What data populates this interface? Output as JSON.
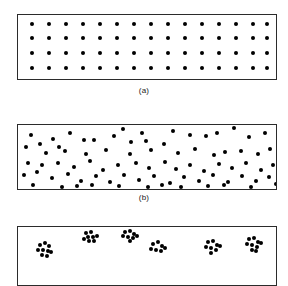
{
  "figure": {
    "background_color": "#ffffff",
    "dot_color": "#000000",
    "border_color": "#2b2b2b",
    "caption_color": "#1a1a1a"
  },
  "panels": [
    {
      "id": "panel-a",
      "caption": "(a)",
      "pattern": "regular",
      "box": {
        "x": 17,
        "y": 14,
        "w": 260,
        "h": 66
      },
      "dot_radius": 2.1,
      "rows": 4,
      "columns": 15,
      "points": [
        [
          14,
          9
        ],
        [
          31,
          9
        ],
        [
          48,
          9
        ],
        [
          65,
          9
        ],
        [
          82,
          9
        ],
        [
          99,
          9
        ],
        [
          116,
          9
        ],
        [
          133,
          9
        ],
        [
          150,
          9
        ],
        [
          167,
          9
        ],
        [
          184,
          9
        ],
        [
          201,
          9
        ],
        [
          218,
          9
        ],
        [
          235,
          9
        ],
        [
          249,
          9
        ],
        [
          14,
          23
        ],
        [
          31,
          23
        ],
        [
          48,
          23
        ],
        [
          65,
          23
        ],
        [
          82,
          23
        ],
        [
          99,
          23
        ],
        [
          116,
          23
        ],
        [
          133,
          23
        ],
        [
          150,
          23
        ],
        [
          167,
          23
        ],
        [
          184,
          23
        ],
        [
          201,
          23
        ],
        [
          218,
          23
        ],
        [
          235,
          23
        ],
        [
          249,
          23
        ],
        [
          14,
          38
        ],
        [
          31,
          38
        ],
        [
          48,
          38
        ],
        [
          65,
          38
        ],
        [
          82,
          38
        ],
        [
          99,
          38
        ],
        [
          116,
          38
        ],
        [
          133,
          38
        ],
        [
          150,
          38
        ],
        [
          167,
          38
        ],
        [
          184,
          38
        ],
        [
          201,
          38
        ],
        [
          218,
          38
        ],
        [
          235,
          38
        ],
        [
          249,
          38
        ],
        [
          14,
          53
        ],
        [
          31,
          53
        ],
        [
          48,
          53
        ],
        [
          65,
          53
        ],
        [
          82,
          53
        ],
        [
          99,
          53
        ],
        [
          116,
          53
        ],
        [
          133,
          53
        ],
        [
          150,
          53
        ],
        [
          167,
          53
        ],
        [
          184,
          53
        ],
        [
          201,
          53
        ],
        [
          218,
          53
        ],
        [
          235,
          53
        ],
        [
          249,
          53
        ]
      ],
      "caption_pos": {
        "y": 86
      }
    },
    {
      "id": "panel-b",
      "caption": "(b)",
      "pattern": "random",
      "box": {
        "x": 17,
        "y": 124,
        "w": 260,
        "h": 66
      },
      "dot_radius": 2.1,
      "points": [
        [
          13,
          10
        ],
        [
          35,
          14
        ],
        [
          52,
          8
        ],
        [
          66,
          15
        ],
        [
          76,
          15
        ],
        [
          96,
          11
        ],
        [
          113,
          17
        ],
        [
          128,
          16
        ],
        [
          146,
          19
        ],
        [
          105,
          4
        ],
        [
          124,
          8
        ],
        [
          155,
          6
        ],
        [
          172,
          10
        ],
        [
          188,
          11
        ],
        [
          199,
          8
        ],
        [
          216,
          3
        ],
        [
          231,
          12
        ],
        [
          247,
          8
        ],
        [
          22,
          19
        ],
        [
          41,
          22
        ],
        [
          8,
          22
        ],
        [
          28,
          28
        ],
        [
          47,
          26
        ],
        [
          68,
          29
        ],
        [
          88,
          25
        ],
        [
          112,
          29
        ],
        [
          133,
          25
        ],
        [
          160,
          28
        ],
        [
          177,
          24
        ],
        [
          196,
          30
        ],
        [
          207,
          27
        ],
        [
          223,
          26
        ],
        [
          240,
          29
        ],
        [
          252,
          24
        ],
        [
          10,
          38
        ],
        [
          24,
          40
        ],
        [
          40,
          38
        ],
        [
          56,
          42
        ],
        [
          72,
          36
        ],
        [
          85,
          45
        ],
        [
          100,
          40
        ],
        [
          118,
          38
        ],
        [
          131,
          43
        ],
        [
          147,
          37
        ],
        [
          158,
          44
        ],
        [
          172,
          40
        ],
        [
          186,
          46
        ],
        [
          201,
          39
        ],
        [
          214,
          43
        ],
        [
          228,
          38
        ],
        [
          243,
          45
        ],
        [
          255,
          40
        ],
        [
          6,
          50
        ],
        [
          19,
          47
        ],
        [
          34,
          53
        ],
        [
          50,
          49
        ],
        [
          63,
          56
        ],
        [
          78,
          51
        ],
        [
          92,
          57
        ],
        [
          106,
          50
        ],
        [
          121,
          55
        ],
        [
          136,
          51
        ],
        [
          152,
          58
        ],
        [
          166,
          52
        ],
        [
          181,
          56
        ],
        [
          195,
          50
        ],
        [
          210,
          57
        ],
        [
          224,
          51
        ],
        [
          238,
          56
        ],
        [
          251,
          52
        ],
        [
          15,
          60
        ],
        [
          44,
          62
        ],
        [
          59,
          61
        ],
        [
          74,
          60
        ],
        [
          101,
          61
        ],
        [
          130,
          62
        ],
        [
          144,
          60
        ],
        [
          163,
          62
        ],
        [
          190,
          61
        ],
        [
          206,
          60
        ],
        [
          233,
          62
        ],
        [
          258,
          59
        ]
      ],
      "caption_pos": {
        "y": 193
      }
    },
    {
      "id": "panel-c",
      "caption": "",
      "pattern": "clustered",
      "box": {
        "x": 17,
        "y": 226,
        "w": 260,
        "h": 60
      },
      "dot_radius": 2.1,
      "clusters": [
        {
          "cx": 27,
          "cy": 22,
          "n": 9
        },
        {
          "cx": 72,
          "cy": 10,
          "n": 8
        },
        {
          "cx": 112,
          "cy": 9,
          "n": 8
        },
        {
          "cx": 140,
          "cy": 20,
          "n": 7
        },
        {
          "cx": 195,
          "cy": 19,
          "n": 8
        },
        {
          "cx": 236,
          "cy": 17,
          "n": 9
        }
      ],
      "points": [
        [
          22,
          18
        ],
        [
          27,
          16
        ],
        [
          31,
          19
        ],
        [
          20,
          23
        ],
        [
          25,
          23
        ],
        [
          30,
          24
        ],
        [
          24,
          28
        ],
        [
          29,
          29
        ],
        [
          33,
          25
        ],
        [
          68,
          6
        ],
        [
          73,
          5
        ],
        [
          70,
          10
        ],
        [
          75,
          10
        ],
        [
          66,
          12
        ],
        [
          71,
          14
        ],
        [
          76,
          14
        ],
        [
          79,
          9
        ],
        [
          107,
          5
        ],
        [
          112,
          4
        ],
        [
          116,
          7
        ],
        [
          105,
          9
        ],
        [
          110,
          10
        ],
        [
          115,
          11
        ],
        [
          119,
          9
        ],
        [
          112,
          14
        ],
        [
          135,
          17
        ],
        [
          140,
          15
        ],
        [
          144,
          19
        ],
        [
          133,
          22
        ],
        [
          138,
          23
        ],
        [
          143,
          24
        ],
        [
          147,
          21
        ],
        [
          190,
          15
        ],
        [
          195,
          14
        ],
        [
          199,
          18
        ],
        [
          188,
          20
        ],
        [
          193,
          21
        ],
        [
          198,
          23
        ],
        [
          202,
          19
        ],
        [
          193,
          26
        ],
        [
          231,
          12
        ],
        [
          236,
          11
        ],
        [
          240,
          15
        ],
        [
          229,
          17
        ],
        [
          234,
          18
        ],
        [
          239,
          20
        ],
        [
          243,
          16
        ],
        [
          234,
          23
        ],
        [
          238,
          24
        ]
      ],
      "caption_pos": {
        "y": 292
      }
    }
  ]
}
